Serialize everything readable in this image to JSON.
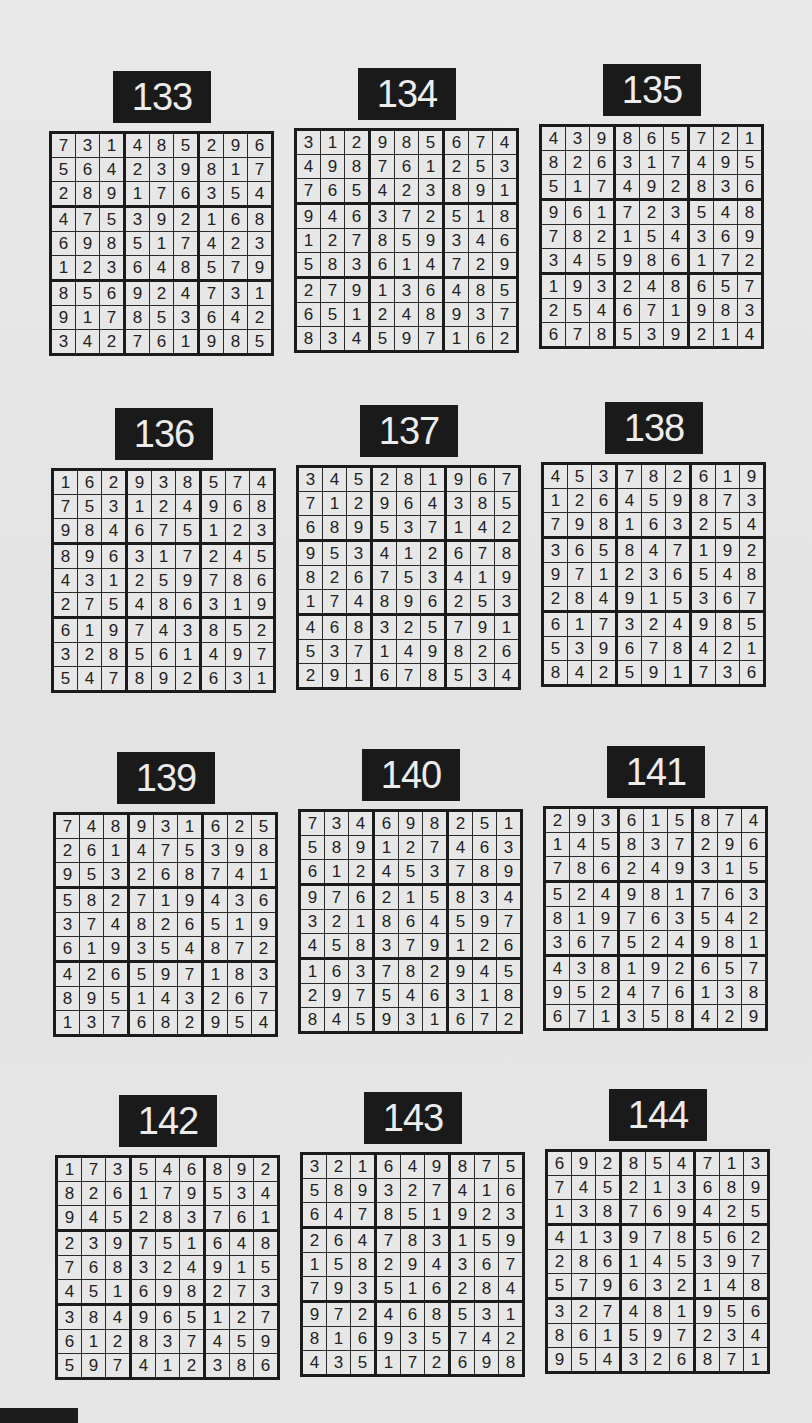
{
  "puzzles": [
    {
      "number": "133",
      "grid": [
        [
          7,
          3,
          1,
          4,
          8,
          5,
          2,
          9,
          6
        ],
        [
          5,
          6,
          4,
          2,
          3,
          9,
          8,
          1,
          7
        ],
        [
          2,
          8,
          9,
          1,
          7,
          6,
          3,
          5,
          4
        ],
        [
          4,
          7,
          5,
          3,
          9,
          2,
          1,
          6,
          8
        ],
        [
          6,
          9,
          8,
          5,
          1,
          7,
          4,
          2,
          3
        ],
        [
          1,
          2,
          3,
          6,
          4,
          8,
          5,
          7,
          9
        ],
        [
          8,
          5,
          6,
          9,
          2,
          4,
          7,
          3,
          1
        ],
        [
          9,
          1,
          7,
          8,
          5,
          3,
          6,
          4,
          2
        ],
        [
          3,
          4,
          2,
          7,
          6,
          1,
          9,
          8,
          5
        ]
      ]
    },
    {
      "number": "134",
      "grid": [
        [
          3,
          1,
          2,
          9,
          8,
          5,
          6,
          7,
          4
        ],
        [
          4,
          9,
          8,
          7,
          6,
          1,
          2,
          5,
          3
        ],
        [
          7,
          6,
          5,
          4,
          2,
          3,
          8,
          9,
          1
        ],
        [
          9,
          4,
          6,
          3,
          7,
          2,
          5,
          1,
          8
        ],
        [
          1,
          2,
          7,
          8,
          5,
          9,
          3,
          4,
          6
        ],
        [
          5,
          8,
          3,
          6,
          1,
          4,
          7,
          2,
          9
        ],
        [
          2,
          7,
          9,
          1,
          3,
          6,
          4,
          8,
          5
        ],
        [
          6,
          5,
          1,
          2,
          4,
          8,
          9,
          3,
          7
        ],
        [
          8,
          3,
          4,
          5,
          9,
          7,
          1,
          6,
          2
        ]
      ]
    },
    {
      "number": "135",
      "grid": [
        [
          4,
          3,
          9,
          8,
          6,
          5,
          7,
          2,
          1
        ],
        [
          8,
          2,
          6,
          3,
          1,
          7,
          4,
          9,
          5
        ],
        [
          5,
          1,
          7,
          4,
          9,
          2,
          8,
          3,
          6
        ],
        [
          9,
          6,
          1,
          7,
          2,
          3,
          5,
          4,
          8
        ],
        [
          7,
          8,
          2,
          1,
          5,
          4,
          3,
          6,
          9
        ],
        [
          3,
          4,
          5,
          9,
          8,
          6,
          1,
          7,
          2
        ],
        [
          1,
          9,
          3,
          2,
          4,
          8,
          6,
          5,
          7
        ],
        [
          2,
          5,
          4,
          6,
          7,
          1,
          9,
          8,
          3
        ],
        [
          6,
          7,
          8,
          5,
          3,
          9,
          2,
          1,
          4
        ]
      ]
    },
    {
      "number": "136",
      "grid": [
        [
          1,
          6,
          2,
          9,
          3,
          8,
          5,
          7,
          4
        ],
        [
          7,
          5,
          3,
          1,
          2,
          4,
          9,
          6,
          8
        ],
        [
          9,
          8,
          4,
          6,
          7,
          5,
          1,
          2,
          3
        ],
        [
          8,
          9,
          6,
          3,
          1,
          7,
          2,
          4,
          5
        ],
        [
          4,
          3,
          1,
          2,
          5,
          9,
          7,
          8,
          6
        ],
        [
          2,
          7,
          5,
          4,
          8,
          6,
          3,
          1,
          9
        ],
        [
          6,
          1,
          9,
          7,
          4,
          3,
          8,
          5,
          2
        ],
        [
          3,
          2,
          8,
          5,
          6,
          1,
          4,
          9,
          7
        ],
        [
          5,
          4,
          7,
          8,
          9,
          2,
          6,
          3,
          1
        ]
      ]
    },
    {
      "number": "137",
      "grid": [
        [
          3,
          4,
          5,
          2,
          8,
          1,
          9,
          6,
          7
        ],
        [
          7,
          1,
          2,
          9,
          6,
          4,
          3,
          8,
          5
        ],
        [
          6,
          8,
          9,
          5,
          3,
          7,
          1,
          4,
          2
        ],
        [
          9,
          5,
          3,
          4,
          1,
          2,
          6,
          7,
          8
        ],
        [
          8,
          2,
          6,
          7,
          5,
          3,
          4,
          1,
          9
        ],
        [
          1,
          7,
          4,
          8,
          9,
          6,
          2,
          5,
          3
        ],
        [
          4,
          6,
          8,
          3,
          2,
          5,
          7,
          9,
          1
        ],
        [
          5,
          3,
          7,
          1,
          4,
          9,
          8,
          2,
          6
        ],
        [
          2,
          9,
          1,
          6,
          7,
          8,
          5,
          3,
          4
        ]
      ]
    },
    {
      "number": "138",
      "grid": [
        [
          4,
          5,
          3,
          7,
          8,
          2,
          6,
          1,
          9
        ],
        [
          1,
          2,
          6,
          4,
          5,
          9,
          8,
          7,
          3
        ],
        [
          7,
          9,
          8,
          1,
          6,
          3,
          2,
          5,
          4
        ],
        [
          3,
          6,
          5,
          8,
          4,
          7,
          1,
          9,
          2
        ],
        [
          9,
          7,
          1,
          2,
          3,
          6,
          5,
          4,
          8
        ],
        [
          2,
          8,
          4,
          9,
          1,
          5,
          3,
          6,
          7
        ],
        [
          6,
          1,
          7,
          3,
          2,
          4,
          9,
          8,
          5
        ],
        [
          5,
          3,
          9,
          6,
          7,
          8,
          4,
          2,
          1
        ],
        [
          8,
          4,
          2,
          5,
          9,
          1,
          7,
          3,
          6
        ]
      ]
    },
    {
      "number": "139",
      "grid": [
        [
          7,
          4,
          8,
          9,
          3,
          1,
          6,
          2,
          5
        ],
        [
          2,
          6,
          1,
          4,
          7,
          5,
          3,
          9,
          8
        ],
        [
          9,
          5,
          3,
          2,
          6,
          8,
          7,
          4,
          1
        ],
        [
          5,
          8,
          2,
          7,
          1,
          9,
          4,
          3,
          6
        ],
        [
          3,
          7,
          4,
          8,
          2,
          6,
          5,
          1,
          9
        ],
        [
          6,
          1,
          9,
          3,
          5,
          4,
          8,
          7,
          2
        ],
        [
          4,
          2,
          6,
          5,
          9,
          7,
          1,
          8,
          3
        ],
        [
          8,
          9,
          5,
          1,
          4,
          3,
          2,
          6,
          7
        ],
        [
          1,
          3,
          7,
          6,
          8,
          2,
          9,
          5,
          4
        ]
      ]
    },
    {
      "number": "140",
      "grid": [
        [
          7,
          3,
          4,
          6,
          9,
          8,
          2,
          5,
          1
        ],
        [
          5,
          8,
          9,
          1,
          2,
          7,
          4,
          6,
          3
        ],
        [
          6,
          1,
          2,
          4,
          5,
          3,
          7,
          8,
          9
        ],
        [
          9,
          7,
          6,
          2,
          1,
          5,
          8,
          3,
          4
        ],
        [
          3,
          2,
          1,
          8,
          6,
          4,
          5,
          9,
          7
        ],
        [
          4,
          5,
          8,
          3,
          7,
          9,
          1,
          2,
          6
        ],
        [
          1,
          6,
          3,
          7,
          8,
          2,
          9,
          4,
          5
        ],
        [
          2,
          9,
          7,
          5,
          4,
          6,
          3,
          1,
          8
        ],
        [
          8,
          4,
          5,
          9,
          3,
          1,
          6,
          7,
          2
        ]
      ]
    },
    {
      "number": "141",
      "grid": [
        [
          2,
          9,
          3,
          6,
          1,
          5,
          8,
          7,
          4
        ],
        [
          1,
          4,
          5,
          8,
          3,
          7,
          2,
          9,
          6
        ],
        [
          7,
          8,
          6,
          2,
          4,
          9,
          3,
          1,
          5
        ],
        [
          5,
          2,
          4,
          9,
          8,
          1,
          7,
          6,
          3
        ],
        [
          8,
          1,
          9,
          7,
          6,
          3,
          5,
          4,
          2
        ],
        [
          3,
          6,
          7,
          5,
          2,
          4,
          9,
          8,
          1
        ],
        [
          4,
          3,
          8,
          1,
          9,
          2,
          6,
          5,
          7
        ],
        [
          9,
          5,
          2,
          4,
          7,
          6,
          1,
          3,
          8
        ],
        [
          6,
          7,
          1,
          3,
          5,
          8,
          4,
          2,
          9
        ]
      ]
    },
    {
      "number": "142",
      "grid": [
        [
          1,
          7,
          3,
          5,
          4,
          6,
          8,
          9,
          2
        ],
        [
          8,
          2,
          6,
          1,
          7,
          9,
          5,
          3,
          4
        ],
        [
          9,
          4,
          5,
          2,
          8,
          3,
          7,
          6,
          1
        ],
        [
          2,
          3,
          9,
          7,
          5,
          1,
          6,
          4,
          8
        ],
        [
          7,
          6,
          8,
          3,
          2,
          4,
          9,
          1,
          5
        ],
        [
          4,
          5,
          1,
          6,
          9,
          8,
          2,
          7,
          3
        ],
        [
          3,
          8,
          4,
          9,
          6,
          5,
          1,
          2,
          7
        ],
        [
          6,
          1,
          2,
          8,
          3,
          7,
          4,
          5,
          9
        ],
        [
          5,
          9,
          7,
          4,
          1,
          2,
          3,
          8,
          6
        ]
      ]
    },
    {
      "number": "143",
      "grid": [
        [
          3,
          2,
          1,
          6,
          4,
          9,
          8,
          7,
          5
        ],
        [
          5,
          8,
          9,
          3,
          2,
          7,
          4,
          1,
          6
        ],
        [
          6,
          4,
          7,
          8,
          5,
          1,
          9,
          2,
          3
        ],
        [
          2,
          6,
          4,
          7,
          8,
          3,
          1,
          5,
          9
        ],
        [
          1,
          5,
          8,
          2,
          9,
          4,
          3,
          6,
          7
        ],
        [
          7,
          9,
          3,
          5,
          1,
          6,
          2,
          8,
          4
        ],
        [
          9,
          7,
          2,
          4,
          6,
          8,
          5,
          3,
          1
        ],
        [
          8,
          1,
          6,
          9,
          3,
          5,
          7,
          4,
          2
        ],
        [
          4,
          3,
          5,
          1,
          7,
          2,
          6,
          9,
          8
        ]
      ]
    },
    {
      "number": "144",
      "grid": [
        [
          6,
          9,
          2,
          8,
          5,
          4,
          7,
          1,
          3
        ],
        [
          7,
          4,
          5,
          2,
          1,
          3,
          6,
          8,
          9
        ],
        [
          1,
          3,
          8,
          7,
          6,
          9,
          4,
          2,
          5
        ],
        [
          4,
          1,
          3,
          9,
          7,
          8,
          5,
          6,
          2
        ],
        [
          2,
          8,
          6,
          1,
          4,
          5,
          3,
          9,
          7
        ],
        [
          5,
          7,
          9,
          6,
          3,
          2,
          1,
          4,
          8
        ],
        [
          3,
          2,
          7,
          4,
          8,
          1,
          9,
          5,
          6
        ],
        [
          8,
          6,
          1,
          5,
          9,
          7,
          2,
          3,
          4
        ],
        [
          9,
          5,
          4,
          3,
          2,
          6,
          8,
          7,
          1
        ]
      ]
    }
  ],
  "layout": {
    "positions": [
      {
        "left": 49,
        "top": 71
      },
      {
        "left": 294,
        "top": 68
      },
      {
        "left": 539,
        "top": 64
      },
      {
        "left": 51,
        "top": 408
      },
      {
        "left": 296,
        "top": 405
      },
      {
        "left": 541,
        "top": 402
      },
      {
        "left": 53,
        "top": 752
      },
      {
        "left": 298,
        "top": 749
      },
      {
        "left": 543,
        "top": 746
      },
      {
        "left": 55,
        "top": 1095
      },
      {
        "left": 300,
        "top": 1092
      },
      {
        "left": 545,
        "top": 1089
      }
    ]
  }
}
